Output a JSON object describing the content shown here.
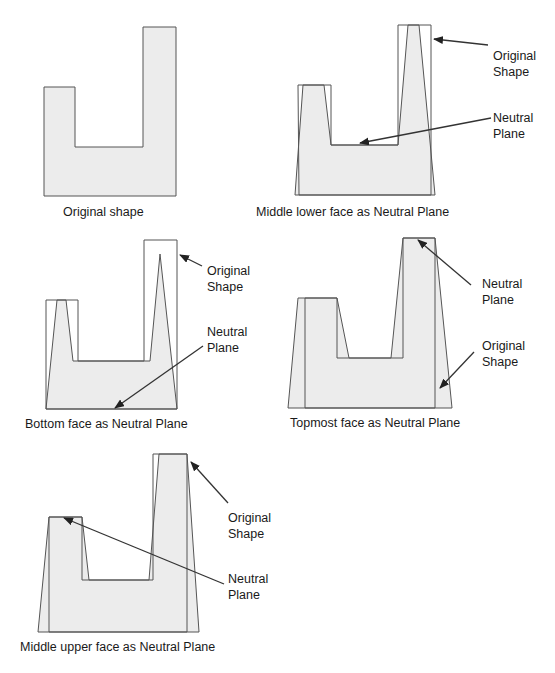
{
  "colors": {
    "fill": "#ececec",
    "stroke": "#555555",
    "text": "#1a1a1a"
  },
  "panels": [
    {
      "id": "original",
      "caption": "Original shape",
      "labels": []
    },
    {
      "id": "middle-lower",
      "caption": "Middle lower face as Neutral Plane",
      "labels": [
        {
          "line1": "Original",
          "line2": "Shape"
        },
        {
          "line1": "Neutral",
          "line2": "Plane"
        }
      ]
    },
    {
      "id": "bottom",
      "caption": "Bottom face as Neutral Plane",
      "labels": [
        {
          "line1": "Original",
          "line2": "Shape"
        },
        {
          "line1": "Neutral",
          "line2": "Plane"
        }
      ]
    },
    {
      "id": "topmost",
      "caption": "Topmost face as Neutral Plane",
      "labels": [
        {
          "line1": "Neutral",
          "line2": "Plane"
        },
        {
          "line1": "Original",
          "line2": "Shape"
        }
      ]
    },
    {
      "id": "middle-upper",
      "caption": "Middle upper face as Neutral Plane",
      "labels": [
        {
          "line1": "Original",
          "line2": "Shape"
        },
        {
          "line1": "Neutral",
          "line2": "Plane"
        }
      ]
    }
  ]
}
